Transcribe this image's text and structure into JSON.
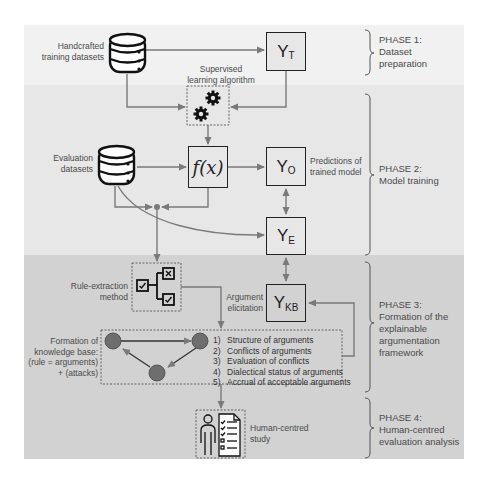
{
  "phases": [
    {
      "title": "PHASE 1:",
      "lines": [
        "Dataset",
        "preparation"
      ]
    },
    {
      "title": "PHASE 2:",
      "lines": [
        "Model training"
      ]
    },
    {
      "title": "PHASE 3:",
      "lines": [
        "Formation of the",
        "explainable",
        "argumentation",
        "framework"
      ]
    },
    {
      "title": "PHASE 4:",
      "lines": [
        "Human-centred",
        "evaluation analysis"
      ]
    }
  ],
  "labels": {
    "handcrafted": [
      "Handcrafted",
      "training datasets"
    ],
    "supervised": [
      "Supervised",
      "learning algorithm"
    ],
    "evaluation": [
      "Evaluation",
      "datasets"
    ],
    "predictions": [
      "Predictions of",
      "trained model"
    ],
    "rule_extraction": [
      "Rule-extraction",
      "method"
    ],
    "argument_elicitation": [
      "Argument",
      "elicitation"
    ],
    "knowledge_base": [
      "Formation of",
      "knowledge base:",
      "(rule = arguments)",
      "+ (attacks)"
    ],
    "human_study": [
      "Human-centred",
      "study"
    ]
  },
  "nodes": {
    "yt": {
      "main": "Y",
      "sub": "T"
    },
    "fx": {
      "main": "f(x)"
    },
    "yo": {
      "main": "Y",
      "sub": "O"
    },
    "ye": {
      "main": "Y",
      "sub": "E"
    },
    "ykb": {
      "main": "Y",
      "sub": "KB"
    }
  },
  "steps": [
    {
      "num": "1)",
      "text": "Structure of arguments"
    },
    {
      "num": "2)",
      "text": "Conflicts of arguments"
    },
    {
      "num": "3)",
      "text": "Evaluation of conflicts"
    },
    {
      "num": "4)",
      "text": "Dialectical status of arguments"
    },
    {
      "num": "5)",
      "text": "Accrual of acceptable arguments"
    }
  ],
  "colors": {
    "band1": "#f1f1f1",
    "band2": "#e7e7e7",
    "band3": "#d2d2d2",
    "arrow": "#7a7a7a",
    "node_circle": "#707070",
    "border": "#222222"
  }
}
